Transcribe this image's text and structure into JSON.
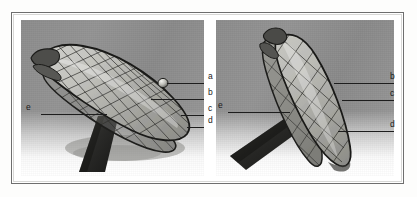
{
  "figure": {
    "type": "photographic-figure",
    "panel_count": 2,
    "frame_color": "#6e6e6e",
    "photo_background_color": "#8e8e8e",
    "annotation_color": "#1b1b1b"
  },
  "panels": [
    {
      "id": "left",
      "name": "panel-left",
      "view": "oblique side view of the braided mesh device, long axis tilted up to the right",
      "labels": [
        {
          "key": "a",
          "text": "a",
          "leader": "horizontal leader line pointing to the small marker bead on the upper mesh surface"
        },
        {
          "key": "b",
          "text": "b",
          "leader": "horizontal leader line pointing to the outer braided mesh layer"
        },
        {
          "key": "c",
          "text": "c",
          "leader": "short leader line pointing to the mid braid region"
        },
        {
          "key": "d",
          "text": "d",
          "leader": "short leader line pointing to the lower braid edge"
        },
        {
          "key": "e",
          "text": "e",
          "leader": "long horizontal leader line from the left margin pointing to the dark support shaft"
        }
      ]
    },
    {
      "id": "right",
      "name": "panel-right",
      "view": "near end-on view of the same braided mesh device on its shaft",
      "labels": [
        {
          "key": "b",
          "text": "b",
          "leader": "horizontal leader line pointing to the outer braided mesh layer"
        },
        {
          "key": "c",
          "text": "c",
          "leader": "horizontal leader line pointing to the inner braid region"
        },
        {
          "key": "d",
          "text": "d",
          "leader": "horizontal leader line pointing to the lower braid edge"
        },
        {
          "key": "e",
          "text": "e",
          "leader": "horizontal leader line from the left margin pointing to the dark support shaft"
        }
      ]
    }
  ]
}
